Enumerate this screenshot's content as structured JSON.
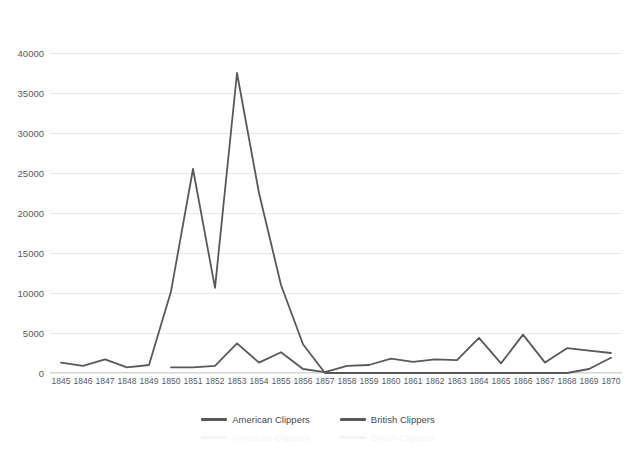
{
  "chart_data": {
    "type": "line",
    "title": "",
    "xlabel": "",
    "ylabel": "",
    "ylim": [
      0,
      40000
    ],
    "ytick_step": 5000,
    "grid": true,
    "legend_position": "bottom",
    "line_color": "#595959",
    "grid_color": "#e8e8e8",
    "tick_color": "#595959",
    "categories": [
      "1845",
      "1846",
      "1847",
      "1848",
      "1849",
      "1850",
      "1851",
      "1852",
      "1853",
      "1854",
      "1855",
      "1856",
      "1857",
      "1858",
      "1859",
      "1860",
      "1861",
      "1862",
      "1863",
      "1864",
      "1865",
      "1866",
      "1867",
      "1868",
      "1869",
      "1870"
    ],
    "yticks": [
      "0",
      "5000",
      "10000",
      "15000",
      "20000",
      "25000",
      "30000",
      "35000",
      "40000"
    ],
    "series": [
      {
        "name": "American Clippers",
        "values": [
          1300,
          900,
          1700,
          700,
          1000,
          10200,
          25500,
          10650,
          37500,
          22500,
          11000,
          3600,
          0,
          0,
          0,
          0,
          0,
          0,
          0,
          0,
          0,
          0,
          0,
          0,
          500,
          1900
        ]
      },
      {
        "name": "British Clippers",
        "values": [
          null,
          null,
          null,
          null,
          null,
          700,
          700,
          900,
          3700,
          1300,
          2600,
          500,
          100,
          900,
          1000,
          1800,
          1400,
          1700,
          1600,
          4400,
          1200,
          4800,
          1300,
          3100,
          2800,
          2500
        ]
      }
    ]
  },
  "legend": {
    "items": [
      {
        "label": "American Clippers"
      },
      {
        "label": "British Clippers"
      }
    ]
  }
}
